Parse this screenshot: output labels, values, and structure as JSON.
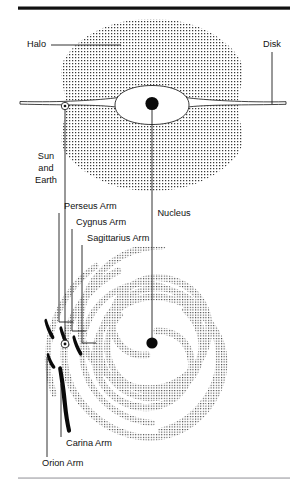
{
  "figure": {
    "background_color": "#ffffff",
    "ink_color": "#111111",
    "stipple_color": "#3a3a3a",
    "rules": {
      "top_rule_color": "#111111",
      "bottom_rule_color": "#9a9aa0"
    },
    "views": [
      {
        "name": "edge-on-view",
        "description": "Edge-on cross section of the Galaxy showing halo, disk and nuclear bulge"
      },
      {
        "name": "face-on-view",
        "description": "Face-on view of the Galaxy showing spiral arms and the Sun's position"
      }
    ],
    "labels": [
      {
        "id": "halo",
        "text": "Halo",
        "view": "edge-on-view",
        "anchor": "end",
        "x": 46,
        "y": 45,
        "leader": "M 51 45 L 121 45"
      },
      {
        "id": "disk",
        "text": "Disk",
        "view": "edge-on-view",
        "anchor": "mid",
        "x": 272,
        "y": 45,
        "leader": "M 272 52 L 272 104"
      },
      {
        "id": "sun-and-earth",
        "text": "Sun and Earth",
        "lines": [
          "Sun",
          "and",
          "Earth"
        ],
        "view": "both",
        "anchor": "mid",
        "x": 46,
        "y": 168,
        "leader": "M 65 110 L 65 343"
      },
      {
        "id": "nucleus",
        "text": "Nucleus",
        "view": "both",
        "anchor": "mid",
        "x": 152,
        "y": 214,
        "leader": "M 152 108 L 152 341"
      },
      {
        "id": "perseus-arm",
        "text": "Perseus Arm",
        "view": "face-on-view",
        "anchor": "start",
        "x": 64,
        "y": 207,
        "leader": "M 61 213 L 61 323 L 74 323"
      },
      {
        "id": "cygnus-arm",
        "text": "Cygnus Arm",
        "view": "face-on-view",
        "anchor": "start",
        "x": 70,
        "y": 223,
        "leader": "M 76 229 L 76 334 L 88 334"
      },
      {
        "id": "sagittarius-arm",
        "text": "Sagittarius Arm",
        "view": "face-on-view",
        "anchor": "start",
        "x": 78,
        "y": 239,
        "leader": "M 84 245 L 84 346 L 96 346"
      },
      {
        "id": "carina-arm",
        "text": "Carina Arm",
        "view": "face-on-view",
        "anchor": "start",
        "x": 62,
        "y": 444,
        "leader": "M 60 438 L 60 375"
      },
      {
        "id": "orion-arm",
        "text": "Orion Arm",
        "view": "face-on-view",
        "anchor": "start",
        "x": 42,
        "y": 464,
        "leader": "M 46 457 L 46 352"
      }
    ],
    "features": {
      "halo": {
        "shape": "stippled sphere",
        "center_x": 152,
        "center_y": 105,
        "radius": 86
      },
      "disk_edge_on": {
        "shape": "thin lens",
        "left_x": 20,
        "right_x": 286,
        "mid_y": 105
      },
      "bulge": {
        "shape": "white lens",
        "center_x": 152,
        "center_y": 105,
        "half_width": 37,
        "half_height": 15
      },
      "nucleus_edge_on": {
        "center_x": 152,
        "center_y": 104,
        "radius": 6.5
      },
      "nucleus_face_on": {
        "center_x": 152,
        "center_y": 343,
        "radius": 5.5
      },
      "sun_symbol_edge_on": {
        "center_x": 65,
        "center_y": 106,
        "radius": 3.6,
        "glyph": "sun-circled-dot"
      },
      "sun_symbol_face_on": {
        "center_x": 65,
        "center_y": 344,
        "radius": 3.6,
        "glyph": "sun-circled-dot"
      },
      "spiral": {
        "center_x": 152,
        "center_y": 343,
        "arm_count": 4,
        "outer_radius": 96
      },
      "local_arm_segments": [
        {
          "id": "perseus-segment",
          "note": "short dark bar, upper left of Sun"
        },
        {
          "id": "cygnus-segment",
          "note": "short dark bar, left of Sun"
        },
        {
          "id": "sagittarius-segment",
          "note": "short dark bar, right of Sun"
        },
        {
          "id": "orion-segment",
          "note": "short dark bar just below Sun"
        },
        {
          "id": "carina-segment",
          "note": "long dark bar running down from Sun"
        }
      ]
    }
  }
}
